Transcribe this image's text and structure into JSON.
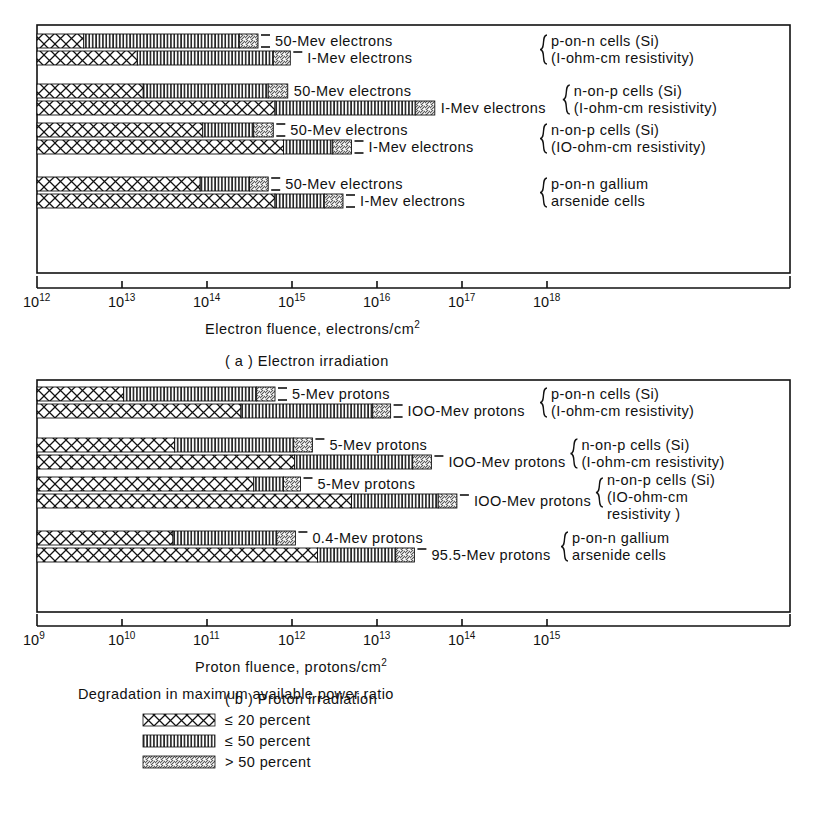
{
  "figure": {
    "panels": [
      {
        "id": "a",
        "caption": "( a )  Electron irradiation",
        "axis_title": "Electron fluence, electrons/cm",
        "axis_title_sup": "2",
        "tick_labels": [
          "10¹²",
          "10¹³",
          "10¹⁴",
          "10¹⁵",
          "10¹⁶",
          "10¹⁷",
          "10¹⁸"
        ],
        "tick_mantissa": "10",
        "tick_exponents": [
          "12",
          "13",
          "14",
          "15",
          "16",
          "17",
          "18"
        ],
        "groups": [
          {
            "brace_lines": [
              "p-on-n cells (Si)",
              "(I-ohm-cm resistivity)"
            ],
            "bars": [
              {
                "label": "50-Mev electrons",
                "seg20_end": 12.55,
                "seg50_end": 14.38,
                "seg_over_end": 14.6,
                "dash": "double"
              },
              {
                "label": "I-Mev electrons",
                "seg20_end": 13.18,
                "seg50_end": 14.78,
                "seg_over_end": 14.98,
                "dash": "single"
              }
            ]
          },
          {
            "brace_lines": [
              "n-on-p cells (Si)",
              "(I-ohm-cm resistivity)"
            ],
            "bars": [
              {
                "label": "50-Mev electrons",
                "seg20_end": 13.25,
                "seg50_end": 14.72,
                "seg_over_end": 14.95,
                "dash": "none"
              },
              {
                "label": "I-Mev electrons",
                "seg20_end": 14.8,
                "seg50_end": 16.45,
                "seg_over_end": 16.68,
                "dash": "none"
              }
            ]
          },
          {
            "brace_lines": [
              "n-on-p cells (Si)",
              "(IO-ohm-cm resistivity)"
            ],
            "bars": [
              {
                "label": "50-Mev electrons",
                "seg20_end": 13.95,
                "seg50_end": 14.55,
                "seg_over_end": 14.78,
                "dash": "double"
              },
              {
                "label": "I-Mev electrons",
                "seg20_end": 14.9,
                "seg50_end": 15.48,
                "seg_over_end": 15.7,
                "dash": "double"
              }
            ]
          },
          {
            "brace_lines": [
              "p-on-n gallium",
              "arsenide cells"
            ],
            "bars": [
              {
                "label": "50-Mev electrons",
                "seg20_end": 13.92,
                "seg50_end": 14.5,
                "seg_over_end": 14.72,
                "dash": "double"
              },
              {
                "label": "I-Mev electrons",
                "seg20_end": 14.8,
                "seg50_end": 15.38,
                "seg_over_end": 15.6,
                "dash": "double"
              }
            ]
          }
        ]
      },
      {
        "id": "b",
        "caption": "( b )  Proton irradiation",
        "axis_title": "Proton fluence,  protons/cm",
        "axis_title_sup": "2",
        "tick_mantissa": "10",
        "tick_exponents": [
          "9",
          "10",
          "11",
          "12",
          "13",
          "14",
          "15"
        ],
        "groups": [
          {
            "brace_lines": [
              "p-on-n cells (Si)",
              "(I-ohm-cm resistivity)"
            ],
            "bars": [
              {
                "label": "5-Mev protons",
                "seg20_end": 10.02,
                "seg50_end": 11.58,
                "seg_over_end": 11.8,
                "dash": "double"
              },
              {
                "label": "IOO-Mev protons",
                "seg20_end": 11.4,
                "seg50_end": 12.95,
                "seg_over_end": 13.16,
                "dash": "double"
              }
            ]
          },
          {
            "brace_lines": [
              "n-on-p cells (Si)",
              "(I-ohm-cm resistivity)"
            ],
            "bars": [
              {
                "label": "5-Mev protons",
                "seg20_end": 10.62,
                "seg50_end": 12.02,
                "seg_over_end": 12.24,
                "dash": "single"
              },
              {
                "label": "IOO-Mev protons",
                "seg20_end": 12.03,
                "seg50_end": 13.42,
                "seg_over_end": 13.64,
                "dash": "single"
              }
            ]
          },
          {
            "brace_lines": [
              "n-on-p cells (Si)",
              "(IO-ohm-cm",
              "resistivity )"
            ],
            "bars": [
              {
                "label": "5-Mev protons",
                "seg20_end": 11.55,
                "seg50_end": 11.9,
                "seg_over_end": 12.1,
                "dash": "single"
              },
              {
                "label": "IOO-Mev protons",
                "seg20_end": 12.7,
                "seg50_end": 13.72,
                "seg_over_end": 13.94,
                "dash": "single"
              }
            ]
          },
          {
            "brace_lines": [
              "p-on-n gallium",
              "arsenide cells"
            ],
            "bars": [
              {
                "label": "0.4-Mev protons",
                "seg20_end": 10.6,
                "seg50_end": 11.82,
                "seg_over_end": 12.04,
                "dash": "single"
              },
              {
                "label": "95.5-Mev protons",
                "seg20_end": 12.3,
                "seg50_end": 13.22,
                "seg_over_end": 13.44,
                "dash": "single"
              }
            ]
          }
        ]
      }
    ],
    "legend": {
      "title": "Degradation in maximum available power ratio",
      "items": [
        {
          "pattern": "crosshatch",
          "label": "≤ 20 percent"
        },
        {
          "pattern": "vertical",
          "label": "≤ 50 percent"
        },
        {
          "pattern": "diagonal",
          "label": "> 50 percent"
        }
      ]
    }
  },
  "chart_data": {
    "type": "bar",
    "orientation": "horizontal",
    "scale": "log10",
    "panels": [
      {
        "name": "Electron irradiation",
        "xlabel": "Electron fluence, electrons/cm^2",
        "xlim": [
          12,
          18
        ],
        "xticks": [
          12,
          13,
          14,
          15,
          16,
          17,
          18
        ],
        "series_names": [
          "<= 20 percent",
          "<= 50 percent",
          "> 50 percent"
        ],
        "rows": [
          {
            "cell": "p-on-n cells (Si), 1-ohm-cm resistivity",
            "particle": "50-Mev electrons",
            "log_end_20": 12.55,
            "log_end_50": 14.38,
            "log_end_over50": 14.6
          },
          {
            "cell": "p-on-n cells (Si), 1-ohm-cm resistivity",
            "particle": "1-Mev electrons",
            "log_end_20": 13.18,
            "log_end_50": 14.78,
            "log_end_over50": 14.98
          },
          {
            "cell": "n-on-p cells (Si), 1-ohm-cm resistivity",
            "particle": "50-Mev electrons",
            "log_end_20": 13.25,
            "log_end_50": 14.72,
            "log_end_over50": 14.95
          },
          {
            "cell": "n-on-p cells (Si), 1-ohm-cm resistivity",
            "particle": "1-Mev electrons",
            "log_end_20": 14.8,
            "log_end_50": 16.45,
            "log_end_over50": 16.68
          },
          {
            "cell": "n-on-p cells (Si), 10-ohm-cm resistivity",
            "particle": "50-Mev electrons",
            "log_end_20": 13.95,
            "log_end_50": 14.55,
            "log_end_over50": 14.78
          },
          {
            "cell": "n-on-p cells (Si), 10-ohm-cm resistivity",
            "particle": "1-Mev electrons",
            "log_end_20": 14.9,
            "log_end_50": 15.48,
            "log_end_over50": 15.7
          },
          {
            "cell": "p-on-n gallium arsenide cells",
            "particle": "50-Mev electrons",
            "log_end_20": 13.92,
            "log_end_50": 14.5,
            "log_end_over50": 14.72
          },
          {
            "cell": "p-on-n gallium arsenide cells",
            "particle": "1-Mev electrons",
            "log_end_20": 14.8,
            "log_end_50": 15.38,
            "log_end_over50": 15.6
          }
        ]
      },
      {
        "name": "Proton irradiation",
        "xlabel": "Proton fluence, protons/cm^2",
        "xlim": [
          9,
          15
        ],
        "xticks": [
          9,
          10,
          11,
          12,
          13,
          14,
          15
        ],
        "series_names": [
          "<= 20 percent",
          "<= 50 percent",
          "> 50 percent"
        ],
        "rows": [
          {
            "cell": "p-on-n cells (Si), 1-ohm-cm resistivity",
            "particle": "5-Mev protons",
            "log_end_20": 10.02,
            "log_end_50": 11.58,
            "log_end_over50": 11.8
          },
          {
            "cell": "p-on-n cells (Si), 1-ohm-cm resistivity",
            "particle": "100-Mev protons",
            "log_end_20": 11.4,
            "log_end_50": 12.95,
            "log_end_over50": 13.16
          },
          {
            "cell": "n-on-p cells (Si), 1-ohm-cm resistivity",
            "particle": "5-Mev protons",
            "log_end_20": 10.62,
            "log_end_50": 12.02,
            "log_end_over50": 12.24
          },
          {
            "cell": "n-on-p cells (Si), 1-ohm-cm resistivity",
            "particle": "100-Mev protons",
            "log_end_20": 12.03,
            "log_end_50": 13.42,
            "log_end_over50": 13.64
          },
          {
            "cell": "n-on-p cells (Si), 10-ohm-cm resistivity",
            "particle": "5-Mev protons",
            "log_end_20": 11.55,
            "log_end_50": 11.9,
            "log_end_over50": 12.1
          },
          {
            "cell": "n-on-p cells (Si), 10-ohm-cm resistivity",
            "particle": "100-Mev protons",
            "log_end_20": 12.7,
            "log_end_50": 13.72,
            "log_end_over50": 13.94
          },
          {
            "cell": "p-on-n gallium arsenide cells",
            "particle": "0.4-Mev protons",
            "log_end_20": 10.6,
            "log_end_50": 11.82,
            "log_end_over50": 12.04
          },
          {
            "cell": "p-on-n gallium arsenide cells",
            "particle": "95.5-Mev protons",
            "log_end_20": 12.3,
            "log_end_50": 13.22,
            "log_end_over50": 13.44
          }
        ]
      }
    ],
    "legend": {
      "title": "Degradation in maximum available power ratio",
      "entries": [
        "<= 20 percent",
        "<= 50 percent",
        "> 50 percent"
      ],
      "position": "bottom"
    },
    "grid": false
  }
}
